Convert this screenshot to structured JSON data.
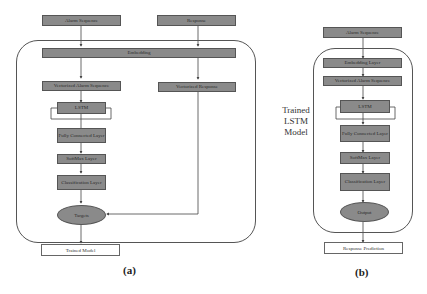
{
  "diagram_a": {
    "inputs": {
      "alarm_sequence": "Alarm Sequence",
      "response": "Response"
    },
    "embedding": "Embedding",
    "vectorized_alarm": "Vectorized Alarm Sequence",
    "vectorized_response": "Vectorized Response",
    "lstm": "LSTM",
    "fully_connected": "Fully Connected Layer",
    "softmax": "SoftMax Layer",
    "classification": "Classification Layer",
    "targets": "Targets",
    "output": "Trained Model",
    "caption": "(a)"
  },
  "diagram_b": {
    "input": "Alarm Sequence",
    "embedding": "Embedding Layer",
    "vectorized_alarm": "Vectorized Alarm Sequence",
    "lstm": "LSTM",
    "fully_connected": "Fully Connected Layer",
    "softmax": "SoftMax Layer",
    "classification": "Classification Layer",
    "output_node": "Output",
    "output": "Response Prediction",
    "side_label": "Trained LSTM Model",
    "caption": "(b)"
  }
}
